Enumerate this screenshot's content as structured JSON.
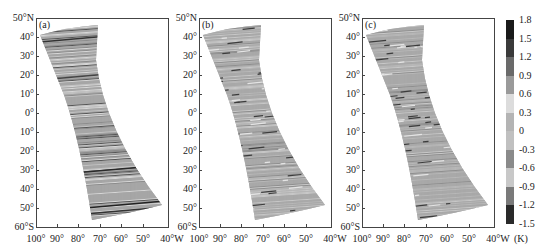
{
  "chart_data": [
    {
      "type": "heatmap",
      "panel_label": "(a)",
      "description": "Satellite swath map of temperature anomaly (K), striped along-track pattern",
      "xlabel": "",
      "ylabel": "",
      "x_ticks": [
        "100°",
        "90°",
        "80°",
        "70°",
        "60°",
        "50°",
        "40°W"
      ],
      "y_ticks": [
        "50°N",
        "40°",
        "30°",
        "20°",
        "10°",
        "0°",
        "10°",
        "20°",
        "30°",
        "40°",
        "50°",
        "60°S"
      ],
      "xlim": [
        -100,
        -40
      ],
      "ylim": [
        -60,
        50
      ],
      "swath_corners": {
        "top_left": [
          -99,
          43
        ],
        "top_right": [
          -73,
          47
        ],
        "bottom_left": [
          -75,
          -56
        ],
        "bottom_right": [
          -43,
          -50
        ]
      },
      "pattern": "strong horizontal dark/light banding"
    },
    {
      "type": "heatmap",
      "panel_label": "(b)",
      "description": "Satellite swath map of temperature anomaly (K), noisier finer striping",
      "x_ticks": [
        "100°",
        "90°",
        "80°",
        "70°",
        "60°",
        "50°",
        "40°W"
      ],
      "y_ticks": [
        "50°N",
        "40°",
        "30°",
        "20°",
        "10°",
        "0°",
        "10°",
        "20°",
        "30°",
        "40°",
        "50°",
        "60°S"
      ],
      "xlim": [
        -100,
        -40
      ],
      "ylim": [
        -60,
        50
      ],
      "swath_corners": {
        "top_left": [
          -99,
          43
        ],
        "top_right": [
          -73,
          47
        ],
        "bottom_left": [
          -75,
          -56
        ],
        "bottom_right": [
          -43,
          -50
        ]
      },
      "pattern": "fine short dark streaks"
    },
    {
      "type": "heatmap",
      "panel_label": "(c)",
      "description": "Satellite swath map of temperature anomaly (K), speckled striping",
      "x_ticks": [
        "100°",
        "90°",
        "80°",
        "70°",
        "60°",
        "50°",
        "40°W"
      ],
      "y_ticks": [
        "50°N",
        "40°",
        "30°",
        "20°",
        "10°",
        "0°",
        "10°",
        "20°",
        "30°",
        "40°",
        "50°",
        "60°S"
      ],
      "xlim": [
        -100,
        -40
      ],
      "ylim": [
        -60,
        50
      ],
      "swath_corners": {
        "top_left": [
          -99,
          43
        ],
        "top_right": [
          -73,
          47
        ],
        "bottom_left": [
          -75,
          -56
        ],
        "bottom_right": [
          -43,
          -50
        ]
      },
      "pattern": "speckled short streaks"
    }
  ],
  "colorbar": {
    "unit": "(K)",
    "ticks": [
      "1.8",
      "1.5",
      "1.2",
      "0.9",
      "0.6",
      "0.3",
      "0",
      "-0.3",
      "-0.6",
      "-0.9",
      "-1.2",
      "-1.5"
    ],
    "segments": [
      {
        "range": [
          1.5,
          1.8
        ],
        "color": "#1a1a1a"
      },
      {
        "range": [
          1.2,
          1.5
        ],
        "color": "#3a3a3a"
      },
      {
        "range": [
          0.9,
          1.2
        ],
        "color": "#6a6a6a"
      },
      {
        "range": [
          0.6,
          0.9
        ],
        "color": "#9a9a9a"
      },
      {
        "range": [
          0.3,
          0.6
        ],
        "color": "#dcdcdc"
      },
      {
        "range": [
          0.0,
          0.3
        ],
        "color": "#b4b4b4"
      },
      {
        "range": [
          -0.3,
          0.0
        ],
        "color": "#c0c0c0"
      },
      {
        "range": [
          -0.6,
          -0.3
        ],
        "color": "#8a8a8a"
      },
      {
        "range": [
          -0.9,
          -0.6
        ],
        "color": "#c8c8c8"
      },
      {
        "range": [
          -1.2,
          -0.9
        ],
        "color": "#7a7a7a"
      },
      {
        "range": [
          -1.5,
          -1.2
        ],
        "color": "#2a2a2a"
      }
    ]
  },
  "panels": [
    {
      "label": "(a)"
    },
    {
      "label": "(b)"
    },
    {
      "label": "(c)"
    }
  ]
}
